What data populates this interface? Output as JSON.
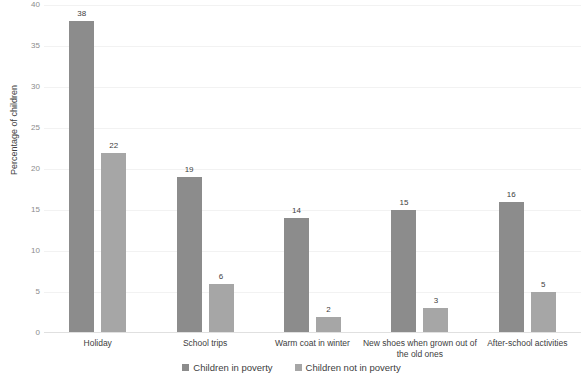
{
  "chart_data": {
    "type": "bar",
    "title": "",
    "subtitle": "",
    "xlabel": "",
    "ylabel": "Percentage of children",
    "ylim": [
      0,
      40
    ],
    "yticks": [
      0,
      5,
      10,
      15,
      20,
      25,
      30,
      35,
      40
    ],
    "grid": true,
    "legend_position": "bottom",
    "categories": [
      "Holiday",
      "School trips",
      "Warm coat in winter",
      "New shoes when grown out of the old ones",
      "After-school activities"
    ],
    "series": [
      {
        "name": "Children in poverty",
        "color": "#8c8c8c",
        "values": [
          38,
          19,
          14,
          15,
          16
        ]
      },
      {
        "name": "Children not in poverty",
        "color": "#a6a6a6",
        "values": [
          22,
          6,
          2,
          3,
          5
        ]
      }
    ],
    "data_labels": {
      "series_0": [
        "38",
        "19",
        "14",
        "15",
        "16"
      ],
      "series_1": [
        "22",
        "6",
        "2",
        "3",
        "5"
      ]
    }
  },
  "axis": {
    "y_title": "Percentage of children",
    "y_tick_labels": [
      "40",
      "35",
      "30",
      "25",
      "20",
      "15",
      "10",
      "5",
      "0"
    ]
  },
  "legend": {
    "items": [
      {
        "label": "Children in poverty",
        "color": "#8c8c8c"
      },
      {
        "label": "Children not in poverty",
        "color": "#a6a6a6"
      }
    ]
  },
  "colors": {
    "series_1": "#8c8c8c",
    "series_2": "#a6a6a6",
    "gridline": "#f2f2f2",
    "tick_text": "#8c8c8c",
    "label_text": "#404040",
    "background": "#ffffff"
  }
}
